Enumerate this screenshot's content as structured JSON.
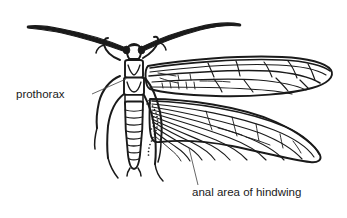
{
  "figure": {
    "background_color": "#ffffff",
    "ink_color": "#1a1a1a",
    "leader_color": "#4a4a4a"
  },
  "labels": [
    {
      "id": "prothorax",
      "text": "prothorax",
      "text_x": 16,
      "text_y": 98,
      "leader": "M 92 94 L 126 79"
    },
    {
      "id": "anal-area-of-hindwing",
      "text": "anal area of hindwing",
      "text_x": 192,
      "text_y": 196,
      "leader": "M 198 185 L 189 148"
    }
  ],
  "parts": {
    "head": "head-with-compound-eyes",
    "antenna_left": "left-antenna",
    "antenna_right": "right-antenna",
    "prothorax": "prothorax-segment",
    "mesothorax": "mesothorax-segment",
    "abdomen": "segmented-abdomen",
    "forewing": "right-forewing",
    "hindwing": "right-hindwing",
    "anal_area": "stippled-anal-area-boundary",
    "legs": "six-legs"
  }
}
